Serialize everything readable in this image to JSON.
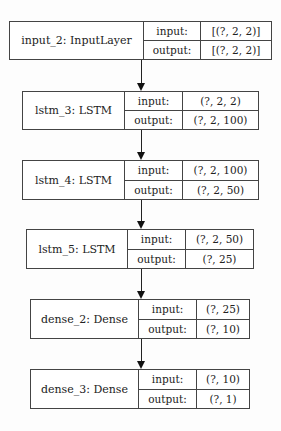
{
  "diagram": {
    "type": "keras-model-plot",
    "layers": [
      {
        "name": "input_2: InputLayer",
        "input_label": "input:",
        "output_label": "output:",
        "input": "[(?, 2, 2)]",
        "output": "[(?, 2, 2)]"
      },
      {
        "name": "lstm_3: LSTM",
        "input_label": "input:",
        "output_label": "output:",
        "input": "(?, 2, 2)",
        "output": "(?, 2, 100)"
      },
      {
        "name": "lstm_4: LSTM",
        "input_label": "input:",
        "output_label": "output:",
        "input": "(?, 2, 100)",
        "output": "(?, 2, 50)"
      },
      {
        "name": "lstm_5: LSTM",
        "input_label": "input:",
        "output_label": "output:",
        "input": "(?, 2, 50)",
        "output": "(?, 25)"
      },
      {
        "name": "dense_2: Dense",
        "input_label": "input:",
        "output_label": "output:",
        "input": "(?, 25)",
        "output": "(?, 10)"
      },
      {
        "name": "dense_3: Dense",
        "input_label": "input:",
        "output_label": "output:",
        "input": "(?, 10)",
        "output": "(?, 1)"
      }
    ],
    "edges": [
      {
        "from": "input_2",
        "to": "lstm_3"
      },
      {
        "from": "lstm_3",
        "to": "lstm_4"
      },
      {
        "from": "lstm_4",
        "to": "lstm_5"
      },
      {
        "from": "lstm_5",
        "to": "dense_2"
      },
      {
        "from": "dense_2",
        "to": "dense_3"
      }
    ]
  }
}
